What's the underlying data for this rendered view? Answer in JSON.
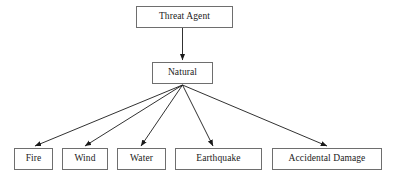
{
  "diagram": {
    "type": "tree-diagram",
    "colors": {
      "background": "#ffffff",
      "box_border": "#6e6e6e",
      "box_fill": "#ffffff",
      "edge": "#1a1a1a",
      "text": "#1a1a1a"
    },
    "nodes": [
      {
        "id": "threat-agent",
        "label": "Threat Agent",
        "x": 136,
        "y": 6,
        "w": 97,
        "h": 22,
        "level": 0
      },
      {
        "id": "natural",
        "label": "Natural",
        "x": 152,
        "y": 62,
        "w": 61,
        "h": 22,
        "level": 1
      },
      {
        "id": "fire",
        "label": "Fire",
        "x": 14,
        "y": 148,
        "w": 39,
        "h": 22,
        "level": 2
      },
      {
        "id": "wind",
        "label": "Wind",
        "x": 62,
        "y": 148,
        "w": 46,
        "h": 22,
        "level": 2
      },
      {
        "id": "water",
        "label": "Water",
        "x": 117,
        "y": 148,
        "w": 49,
        "h": 22,
        "level": 2
      },
      {
        "id": "earthquake",
        "label": "Earthquake",
        "x": 175,
        "y": 148,
        "w": 87,
        "h": 22,
        "level": 2
      },
      {
        "id": "accidental-damage",
        "label": "Accidental Damage",
        "x": 272,
        "y": 148,
        "w": 110,
        "h": 22,
        "level": 2
      }
    ],
    "edges": [
      {
        "id": "edge-threat-agent-natural",
        "from": "threat-agent",
        "to": "natural",
        "x1": 182.5,
        "y1": 28,
        "x2": 182.5,
        "y2": 60
      },
      {
        "id": "edge-natural-fire",
        "from": "natural",
        "to": "fire",
        "x1": 182.5,
        "y1": 85,
        "x2": 35,
        "y2": 146
      },
      {
        "id": "edge-natural-wind",
        "from": "natural",
        "to": "wind",
        "x1": 182.5,
        "y1": 85,
        "x2": 85,
        "y2": 146
      },
      {
        "id": "edge-natural-water",
        "from": "natural",
        "to": "water",
        "x1": 182.5,
        "y1": 85,
        "x2": 141,
        "y2": 146
      },
      {
        "id": "edge-natural-earthquake",
        "from": "natural",
        "to": "earthquake",
        "x1": 182.5,
        "y1": 85,
        "x2": 213,
        "y2": 146
      },
      {
        "id": "edge-natural-accidental",
        "from": "natural",
        "to": "accidental-damage",
        "x1": 182.5,
        "y1": 85,
        "x2": 327,
        "y2": 146
      }
    ]
  }
}
